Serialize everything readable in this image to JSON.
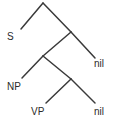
{
  "diagram": {
    "type": "binary-tree",
    "width": 113,
    "height": 124,
    "background_color": "#ffffff",
    "edge_color": "#3a3a3a",
    "label_color": "#2b2b2b",
    "nodes": [
      {
        "id": "root",
        "kind": "branch",
        "x": 43,
        "y": 3
      },
      {
        "id": "n1",
        "kind": "branch",
        "x": 71,
        "y": 32
      },
      {
        "id": "n2",
        "kind": "branch",
        "x": 43,
        "y": 56
      },
      {
        "id": "n3",
        "kind": "branch",
        "x": 71,
        "y": 79
      },
      {
        "id": "leaf1",
        "kind": "leaf",
        "label": "S",
        "x": 21,
        "y": 29
      },
      {
        "id": "leaf2",
        "kind": "leaf",
        "label": "nil",
        "x": 95,
        "y": 58
      },
      {
        "id": "leaf3",
        "kind": "leaf",
        "label": "NP",
        "x": 22,
        "y": 78
      },
      {
        "id": "leaf4",
        "kind": "leaf",
        "label": "VP",
        "x": 46,
        "y": 103
      },
      {
        "id": "leaf5",
        "kind": "leaf",
        "label": "nil",
        "x": 95,
        "y": 103
      }
    ],
    "edges": [
      {
        "from": "root",
        "to": "leaf1",
        "x1": 43,
        "y1": 3,
        "x2": 21,
        "y2": 29
      },
      {
        "from": "root",
        "to": "n1",
        "x1": 43,
        "y1": 3,
        "x2": 71,
        "y2": 32
      },
      {
        "from": "n1",
        "to": "n2",
        "x1": 71,
        "y1": 32,
        "x2": 43,
        "y2": 56
      },
      {
        "from": "n1",
        "to": "leaf2",
        "x1": 71,
        "y1": 32,
        "x2": 95,
        "y2": 58
      },
      {
        "from": "n2",
        "to": "leaf3",
        "x1": 43,
        "y1": 56,
        "x2": 22,
        "y2": 78
      },
      {
        "from": "n2",
        "to": "n3",
        "x1": 43,
        "y1": 56,
        "x2": 71,
        "y2": 79
      },
      {
        "from": "n3",
        "to": "leaf4",
        "x1": 71,
        "y1": 79,
        "x2": 46,
        "y2": 103
      },
      {
        "from": "n3",
        "to": "leaf5",
        "x1": 71,
        "y1": 79,
        "x2": 95,
        "y2": 103
      }
    ],
    "labels": {
      "s": "S",
      "nil_upper": "nil",
      "np": "NP",
      "vp": "VP",
      "nil_lower": "nil"
    }
  }
}
